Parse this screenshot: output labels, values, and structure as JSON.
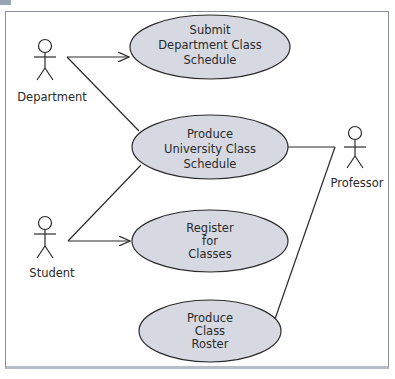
{
  "diagram": {
    "type": "UML use case diagram",
    "colors": {
      "use_case_fill": "#d6d9e2",
      "stroke": "#2b2b2b",
      "frame_border": "#8a8e96"
    },
    "actors": [
      {
        "id": "department",
        "label": "Department"
      },
      {
        "id": "student",
        "label": "Student"
      },
      {
        "id": "professor",
        "label": "Professor"
      }
    ],
    "use_cases": [
      {
        "id": "submit",
        "lines": [
          "Submit",
          "Department Class",
          "Schedule"
        ]
      },
      {
        "id": "produce_schedule",
        "lines": [
          "Produce",
          "University Class",
          "Schedule"
        ]
      },
      {
        "id": "register",
        "lines": [
          "Register",
          "for",
          "Classes"
        ]
      },
      {
        "id": "roster",
        "lines": [
          "Produce",
          "Class",
          "Roster"
        ]
      }
    ],
    "associations": [
      {
        "from": "department",
        "to": "submit",
        "arrow": true
      },
      {
        "from": "department",
        "to": "produce_schedule",
        "arrow": false
      },
      {
        "from": "student",
        "to": "produce_schedule",
        "arrow": false
      },
      {
        "from": "student",
        "to": "register",
        "arrow": true
      },
      {
        "from": "professor",
        "to": "produce_schedule",
        "arrow": false
      },
      {
        "from": "professor",
        "to": "roster",
        "arrow": false
      }
    ]
  }
}
